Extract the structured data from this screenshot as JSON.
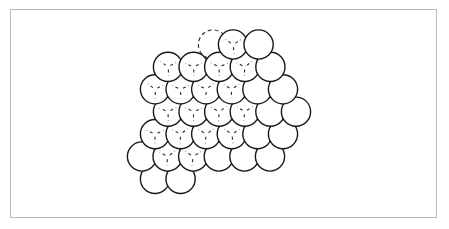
{
  "figure": {
    "caption": "",
    "description": "A hexagonal close-packed layer of equal spheres drawn as outlined circles, with short dashed tick marks inside the interior spheres indicating contact points with the spheres of the layer beneath, and one dashed circle outline at the upper edge indicating a sphere of the hidden layer.",
    "background_color": "#ffffff",
    "frame_border_color": "#b9b9b9",
    "circle_stroke_color": "#1a1a1a",
    "circle_fill_color": "#ffffff",
    "dash_stroke_color": "#2b2b2b",
    "frame": {
      "x": 10,
      "y": 9,
      "width": 427,
      "height": 209
    }
  },
  "packing": {
    "type": "hexagonal-close-packed-layer",
    "circle_radius": 14.6,
    "row_pitch_x": 25.6,
    "row_pitch_y": 22.4,
    "total_spheres": 37,
    "dashed_outline_spheres": 1,
    "rows": [
      {
        "index": 0,
        "count": 2,
        "y": 44.5,
        "x_start": 233.0,
        "marked": [
          0
        ]
      },
      {
        "index": 1,
        "count": 5,
        "y": 66.9,
        "x_start": 168.0,
        "marked": [
          0,
          1,
          2,
          3
        ]
      },
      {
        "index": 2,
        "count": 6,
        "y": 89.3,
        "x_start": 155.0,
        "marked": [
          0,
          1,
          2,
          3
        ]
      },
      {
        "index": 3,
        "count": 6,
        "y": 111.7,
        "x_start": 168.0,
        "marked": [
          0,
          1,
          2,
          3
        ]
      },
      {
        "index": 4,
        "count": 6,
        "y": 134.1,
        "x_start": 155.0,
        "marked": [
          0,
          1,
          2,
          3
        ]
      },
      {
        "index": 5,
        "count": 6,
        "y": 156.5,
        "x_start": 142.0,
        "marked": [
          1,
          2
        ]
      },
      {
        "index": 6,
        "count": 2,
        "y": 178.9,
        "x_start": 155.0,
        "marked": []
      }
    ],
    "ghost_sphere": {
      "x": 213.0,
      "y": 44.5,
      "radius": 14.6,
      "style": "dashed"
    }
  },
  "markings": {
    "tick_count_per_sphere": 3,
    "tick_angles_deg": [
      90,
      210,
      330
    ],
    "tick_inner_fraction": 0.18,
    "tick_outer_fraction": 0.62,
    "dash_pattern": "3 3",
    "meaning": "contact points with spheres of the layer below"
  }
}
